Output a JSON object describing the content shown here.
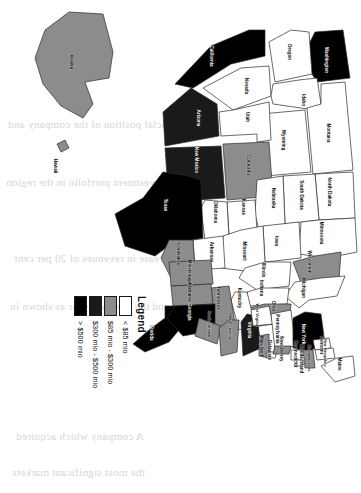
{
  "figure": {
    "type": "choropleth-map",
    "region": "United States",
    "orientation_note": "figure printed rotated 90 degrees on the page"
  },
  "legend": {
    "title": "Legend",
    "entries": [
      {
        "label": "< $85 mio",
        "color": "#ffffff",
        "band": "under-85"
      },
      {
        "label": "$85 mio - $300 mio",
        "color": "#8c8c8c",
        "band": "85-300"
      },
      {
        "label": "$300 mio - $500 mio",
        "color": "#1a1a1a",
        "band": "300-500"
      },
      {
        "label": "> $500 mio",
        "color": "#000000",
        "band": "over-500"
      }
    ]
  },
  "chart_data": {
    "type": "heatmap",
    "title": "Legend",
    "xlabel": "",
    "ylabel": "",
    "categories": [
      "Washington",
      "Oregon",
      "California",
      "Nevada",
      "Idaho",
      "Montana",
      "Wyoming",
      "Utah",
      "Arizona",
      "Colorado",
      "New Mexico",
      "North Dakota",
      "South Dakota",
      "Nebraska",
      "Kansas",
      "Oklahoma",
      "Texas",
      "Minnesota",
      "Iowa",
      "Missouri",
      "Arkansas",
      "Louisiana",
      "Wisconsin",
      "Illinois",
      "Michigan",
      "Indiana",
      "Ohio",
      "Kentucky",
      "Tennessee",
      "Mississippi",
      "Alabama",
      "Florida",
      "Georgia",
      "South Carolina",
      "North Carolina",
      "Virginia",
      "West Virginia",
      "Maryland",
      "Delaware",
      "Pennsylvania",
      "New Jersey",
      "New York",
      "Connecticut",
      "Rhode Island",
      "Massachusetts",
      "Vermont",
      "New Hampshire",
      "Maine",
      "Alaska",
      "Hawaii"
    ],
    "values": [
      "> $500 mio",
      "< $85 mio",
      "> $500 mio",
      "< $85 mio",
      "< $85 mio",
      "< $85 mio",
      "< $85 mio",
      "< $85 mio",
      "$300 mio - $500 mio",
      "$85 mio - $300 mio",
      "$300 mio - $500 mio",
      "< $85 mio",
      "< $85 mio",
      "< $85 mio",
      "< $85 mio",
      "< $85 mio",
      "> $500 mio",
      "< $85 mio",
      "< $85 mio",
      "< $85 mio",
      "< $85 mio",
      "$85 mio - $300 mio",
      "$85 mio - $300 mio",
      "< $85 mio",
      "< $85 mio",
      "< $85 mio",
      "$85 mio - $300 mio",
      "< $85 mio",
      "$85 mio - $300 mio",
      "$85 mio - $300 mio",
      "$85 mio - $300 mio",
      "> $500 mio",
      "> $500 mio",
      "$85 mio - $300 mio",
      "$85 mio - $300 mio",
      "$300 mio - $500 mio",
      "< $85 mio",
      "$85 mio - $300 mio",
      "< $85 mio",
      "< $85 mio",
      "$85 mio - $300 mio",
      "> $500 mio",
      "< $85 mio",
      "< $85 mio",
      "$85 mio - $300 mio",
      "< $85 mio",
      "< $85 mio",
      "< $85 mio",
      "$85 mio - $300 mio",
      "$85 mio - $300 mio"
    ],
    "legend_position": "right"
  },
  "states": [
    {
      "name": "Washington",
      "short": "WA",
      "fill": "#000000",
      "dark": true,
      "lx": 60,
      "ly": 35
    },
    {
      "name": "Oregon",
      "short": "OR",
      "fill": "#ffffff",
      "dark": false,
      "lx": 52,
      "ly": 72
    },
    {
      "name": "California",
      "short": "CA",
      "fill": "#000000",
      "dark": true,
      "lx": 56,
      "ly": 150
    },
    {
      "name": "Nevada",
      "short": "NV",
      "fill": "#ffffff",
      "dark": false,
      "lx": 86,
      "ly": 115
    },
    {
      "name": "Idaho",
      "short": "ID",
      "fill": "#ffffff",
      "dark": false,
      "lx": 100,
      "ly": 58
    },
    {
      "name": "Montana",
      "short": "MT",
      "fill": "#ffffff",
      "dark": false,
      "lx": 133,
      "ly": 33
    },
    {
      "name": "Wyoming",
      "short": "WY",
      "fill": "#ffffff",
      "dark": false,
      "lx": 140,
      "ly": 78
    },
    {
      "name": "Utah",
      "short": "UT",
      "fill": "#ffffff",
      "dark": false,
      "lx": 117,
      "ly": 114
    },
    {
      "name": "Arizona",
      "short": "AZ",
      "fill": "#1a1a1a",
      "dark": true,
      "lx": 118,
      "ly": 163
    },
    {
      "name": "Colorado",
      "short": "CO",
      "fill": "#8c8c8c",
      "dark": false,
      "lx": 165,
      "ly": 113
    },
    {
      "name": "New Mexico",
      "short": "NM",
      "fill": "#1a1a1a",
      "dark": true,
      "lx": 160,
      "ly": 165
    },
    {
      "name": "North Dakota",
      "short": "ND",
      "fill": "#ffffff",
      "dark": false,
      "lx": 192,
      "ly": 32
    },
    {
      "name": "South Dakota",
      "short": "SD",
      "fill": "#ffffff",
      "dark": false,
      "lx": 195,
      "ly": 60
    },
    {
      "name": "Nebraska",
      "short": "NE",
      "fill": "#ffffff",
      "dark": false,
      "lx": 198,
      "ly": 88
    },
    {
      "name": "Kansas",
      "short": "KS",
      "fill": "#ffffff",
      "dark": false,
      "lx": 207,
      "ly": 118
    },
    {
      "name": "Oklahoma",
      "short": "OK",
      "fill": "#ffffff",
      "dark": false,
      "lx": 212,
      "ly": 146
    },
    {
      "name": "Texas",
      "short": "TX",
      "fill": "#000000",
      "dark": true,
      "lx": 205,
      "ly": 196
    },
    {
      "name": "Minnesota",
      "short": "MN",
      "fill": "#ffffff",
      "dark": false,
      "lx": 233,
      "ly": 40
    },
    {
      "name": "Iowa",
      "short": "IA",
      "fill": "#ffffff",
      "dark": false,
      "lx": 241,
      "ly": 85
    },
    {
      "name": "Missouri",
      "short": "MO",
      "fill": "#ffffff",
      "dark": false,
      "lx": 251,
      "ly": 117
    },
    {
      "name": "Arkansas",
      "short": "AR",
      "fill": "#ffffff",
      "dark": false,
      "lx": 252,
      "ly": 150
    },
    {
      "name": "Louisiana",
      "short": "LA",
      "fill": "#8c8c8c",
      "dark": false,
      "lx": 254,
      "ly": 183
    },
    {
      "name": "Wisconsin",
      "short": "WI",
      "fill": "#8c8c8c",
      "dark": false,
      "lx": 262,
      "ly": 52
    },
    {
      "name": "Illinois",
      "short": "IL",
      "fill": "#ffffff",
      "dark": false,
      "lx": 270,
      "ly": 98
    },
    {
      "name": "Michigan",
      "short": "MI",
      "fill": "#ffffff",
      "dark": false,
      "lx": 288,
      "ly": 58
    },
    {
      "name": "Indiana",
      "short": "IN",
      "fill": "#ffffff",
      "dark": false,
      "lx": 288,
      "ly": 100
    },
    {
      "name": "Ohio",
      "short": "OH",
      "fill": "#8c8c8c",
      "dark": false,
      "lx": 306,
      "ly": 88
    },
    {
      "name": "Kentucky",
      "short": "KY",
      "fill": "#ffffff",
      "dark": false,
      "lx": 298,
      "ly": 122
    },
    {
      "name": "Tennessee",
      "short": "TN",
      "fill": "#8c8c8c",
      "dark": false,
      "lx": 298,
      "ly": 143
    },
    {
      "name": "Mississippi",
      "short": "MS",
      "fill": "#8c8c8c",
      "dark": false,
      "lx": 272,
      "ly": 172
    },
    {
      "name": "Alabama",
      "short": "AL",
      "fill": "#8c8c8c",
      "dark": false,
      "lx": 292,
      "ly": 172
    },
    {
      "name": "Florida",
      "short": "FL",
      "fill": "#000000",
      "dark": true,
      "lx": 333,
      "ly": 210
    },
    {
      "name": "Georgia",
      "short": "GA",
      "fill": "#000000",
      "dark": true,
      "lx": 312,
      "ly": 172
    },
    {
      "name": "South Carolina",
      "short": "SC",
      "fill": "#8c8c8c",
      "dark": false,
      "lx": 324,
      "ly": 152
    },
    {
      "name": "North Carolina",
      "short": "NC",
      "fill": "#8c8c8c",
      "dark": false,
      "lx": 327,
      "ly": 131
    },
    {
      "name": "Virginia",
      "short": "VA",
      "fill": "#1a1a1a",
      "dark": true,
      "lx": 330,
      "ly": 112
    },
    {
      "name": "West Virginia",
      "short": "WV",
      "fill": "#ffffff",
      "dark": false,
      "lx": 315,
      "ly": 104
    },
    {
      "name": "Maryland",
      "short": "MD",
      "fill": "#8c8c8c",
      "dark": false,
      "lx": 346,
      "ly": 100
    },
    {
      "name": "Delaware",
      "short": "DE",
      "fill": "#ffffff",
      "dark": false,
      "lx": 350,
      "ly": 92
    },
    {
      "name": "Pennsylvania",
      "short": "PA",
      "fill": "#ffffff",
      "dark": false,
      "lx": 329,
      "ly": 84
    },
    {
      "name": "New Jersey",
      "short": "NJ",
      "fill": "#8c8c8c",
      "dark": false,
      "lx": 349,
      "ly": 80
    },
    {
      "name": "New York",
      "short": "NY",
      "fill": "#000000",
      "dark": true,
      "lx": 334,
      "ly": 58
    },
    {
      "name": "Connecticut",
      "short": "CT",
      "fill": "#ffffff",
      "dark": false,
      "lx": 354,
      "ly": 66
    },
    {
      "name": "Rhode Island",
      "short": "RI",
      "fill": "#ffffff",
      "dark": false,
      "lx": 359,
      "ly": 60
    },
    {
      "name": "Massachusetts",
      "short": "MA",
      "fill": "#8c8c8c",
      "dark": false,
      "lx": 358,
      "ly": 52
    },
    {
      "name": "Vermont",
      "short": "VT",
      "fill": "#ffffff",
      "dark": false,
      "lx": 345,
      "ly": 40
    },
    {
      "name": "New Hampshire",
      "short": "NH",
      "fill": "#ffffff",
      "dark": false,
      "lx": 353,
      "ly": 36
    },
    {
      "name": "Maine",
      "short": "ME",
      "fill": "#ffffff",
      "dark": false,
      "lx": 364,
      "ly": 22
    },
    {
      "name": "Alaska",
      "short": "AK",
      "fill": "#8c8c8c",
      "dark": false,
      "lx": 62,
      "ly": 290
    },
    {
      "name": "Hawaii",
      "short": "HI",
      "fill": "#8c8c8c",
      "dark": false,
      "lx": 166,
      "ly": 306
    }
  ],
  "background_text": {
    "lines": [
      "to the financial position of the company and",
      "of the investment portfolio in the region",
      "an increase in revenues of 20 per cent",
      "and the previous year as shown in",
      "A company which acquired",
      "the most significant markets"
    ]
  }
}
